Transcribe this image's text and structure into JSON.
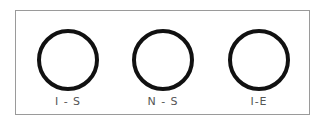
{
  "diagram": {
    "items": [
      {
        "label": "I - S"
      },
      {
        "label": "N - S"
      },
      {
        "label": "I-E"
      }
    ]
  }
}
